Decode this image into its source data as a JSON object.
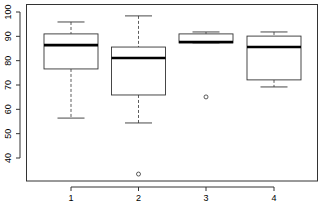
{
  "chart_data": {
    "type": "boxplot",
    "title": "",
    "xlabel": "",
    "ylabel": "",
    "categories": [
      "1",
      "2",
      "3",
      "4"
    ],
    "ylim": [
      28,
      102
    ],
    "yticks": [
      40,
      50,
      60,
      70,
      80,
      90,
      100
    ],
    "grid": false,
    "legend": null,
    "boxes": [
      {
        "label": "1",
        "whisker_low": 56.4,
        "q1": 76.6,
        "median": 86.4,
        "q3": 91.0,
        "whisker_high": 95.9,
        "outliers": []
      },
      {
        "label": "2",
        "whisker_low": 54.4,
        "q1": 65.9,
        "median": 81.1,
        "q3": 85.6,
        "whisker_high": 98.4,
        "outliers": [
          33.4
        ]
      },
      {
        "label": "3",
        "whisker_low": 87.3,
        "q1": 87.3,
        "median": 87.7,
        "q3": 91.0,
        "whisker_high": 91.8,
        "outliers": [
          65.1
        ]
      },
      {
        "label": "4",
        "whisker_low": 69.2,
        "q1": 72.1,
        "median": 85.6,
        "q3": 90.1,
        "whisker_high": 91.8,
        "outliers": []
      }
    ]
  },
  "axes": {
    "y_tick_labels": [
      "40",
      "50",
      "60",
      "70",
      "80",
      "90",
      "100"
    ],
    "x_tick_labels": [
      "1",
      "2",
      "3",
      "4"
    ]
  },
  "colors": {
    "box_stroke": "#333333",
    "median": "#000000",
    "background": "#ffffff"
  }
}
